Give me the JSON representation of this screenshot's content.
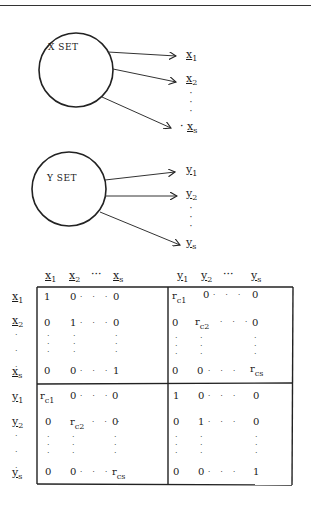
{
  "x_set": {
    "label": "X SET",
    "outputs": [
      {
        "var": "x",
        "sub": "1"
      },
      {
        "var": "x",
        "sub": "2"
      },
      {
        "var": "x",
        "sub": "s"
      }
    ]
  },
  "y_set": {
    "label": "Y SET",
    "outputs": [
      {
        "var": "y",
        "sub": "1"
      },
      {
        "var": "y",
        "sub": "2"
      },
      {
        "var": "y",
        "sub": "s"
      }
    ]
  },
  "matrix": {
    "col_headers": {
      "x": [
        {
          "var": "x",
          "sub": "1"
        },
        {
          "var": "x",
          "sub": "2"
        },
        {
          "ellipsis": "···"
        },
        {
          "var": "x",
          "sub": "s"
        }
      ],
      "y": [
        {
          "var": "y",
          "sub": "1"
        },
        {
          "var": "y",
          "sub": "2"
        },
        {
          "ellipsis": "···"
        },
        {
          "var": "y",
          "sub": "s"
        }
      ]
    },
    "row_headers": [
      {
        "var": "x",
        "sub": "1"
      },
      {
        "var": "x",
        "sub": "2"
      },
      {
        "var": "x",
        "sub": "s"
      },
      {
        "var": "y",
        "sub": "1"
      },
      {
        "var": "y",
        "sub": "2"
      },
      {
        "var": "y",
        "sub": "s"
      }
    ],
    "blocks": {
      "xx": [
        [
          "1",
          "0",
          "0"
        ],
        [
          "0",
          "1",
          "0"
        ],
        [
          "0",
          "0",
          "1"
        ]
      ],
      "xy": [
        [
          "r_c1",
          "0",
          "0"
        ],
        [
          "0",
          "r_c2",
          "0"
        ],
        [
          "0",
          "0",
          "r_cs"
        ]
      ],
      "yx": [
        [
          "r_c1",
          "0",
          "0"
        ],
        [
          "0",
          "r_c2",
          "0"
        ],
        [
          "0",
          "0",
          "r_cs"
        ]
      ],
      "yy": [
        [
          "1",
          "0",
          "0"
        ],
        [
          "0",
          "1",
          "0"
        ],
        [
          "0",
          "0",
          "1"
        ]
      ]
    },
    "labels": {
      "one": "1",
      "zero": "0",
      "r": "r",
      "c1": "c1",
      "c2": "c2",
      "cs": "cs",
      "dots": "· · ·",
      "ellipsis": "···"
    }
  }
}
